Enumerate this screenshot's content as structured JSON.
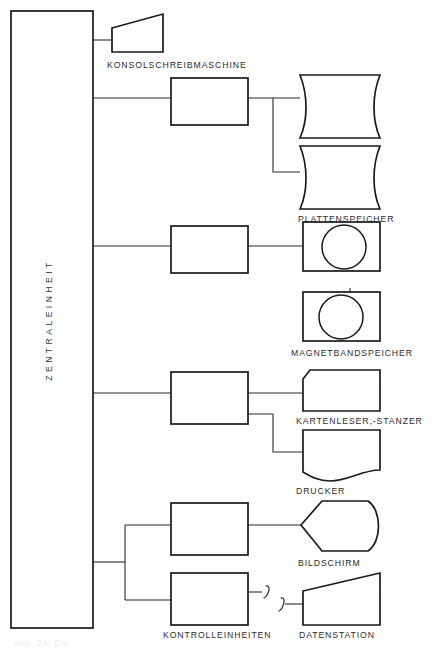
{
  "diagram": {
    "central_unit": {
      "label": "ZENTRALEINHEIT",
      "orientation": "vertical-bottom-to-top"
    },
    "channels": [
      {
        "id": "channel-console",
        "label": ""
      },
      {
        "id": "channel-disk",
        "label": ""
      },
      {
        "id": "channel-tape",
        "label": ""
      },
      {
        "id": "channel-cards-printer",
        "label": ""
      },
      {
        "id": "channel-terminals",
        "label": ""
      }
    ],
    "peripherals": [
      {
        "id": "console-typewriter",
        "label": "KONSOLSCHREIBMASCHINE",
        "shape": "keyboard-trapezoid"
      },
      {
        "id": "disk-storage",
        "label": "PLATTENSPEICHER",
        "shape": "disk-cylinder",
        "count": 2
      },
      {
        "id": "tape-storage",
        "label": "MAGNETBANDSPEICHER",
        "shape": "tape-reel",
        "count": 2
      },
      {
        "id": "card-reader-punch",
        "label": "KARTENLESER,-STANZER",
        "shape": "punched-card"
      },
      {
        "id": "printer",
        "label": "DRUCKER",
        "shape": "document-wave"
      },
      {
        "id": "display-screen",
        "label": "BILDSCHIRM",
        "shape": "display-pentagon"
      },
      {
        "id": "control-units",
        "label": "KONTROLLEINHEITEN",
        "shape": "rectangle",
        "count": 2
      },
      {
        "id": "data-station",
        "label": "DATENSTATION",
        "shape": "keyboard-trapezoid"
      }
    ],
    "annotations": {
      "line_break_symbol": "remote-link-break",
      "bottom_caption": "Abb. 24: Ein"
    },
    "colors": {
      "stroke": "#1a1a1a",
      "connector": "#2a2a2a",
      "text": "#2b2b2b",
      "background": "#ffffff"
    }
  }
}
